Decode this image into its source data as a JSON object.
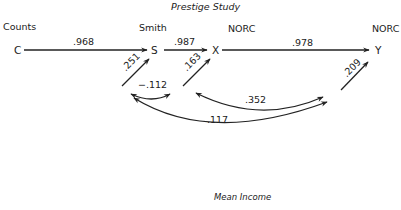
{
  "diagram": {
    "title": "Prestige Study",
    "footer": "Mean Income",
    "group_labels": {
      "counts": "Counts",
      "smith": "Smith",
      "norc_x": "NORC",
      "norc_y": "NORC"
    },
    "nodes": {
      "C": "C",
      "S": "S",
      "X": "X",
      "Y": "Y"
    },
    "paths": [
      {
        "from": "C",
        "to": "S",
        "coefficient": ".968"
      },
      {
        "from": "S",
        "to": "X",
        "coefficient": ".987"
      },
      {
        "from": "X",
        "to": "Y",
        "coefficient": ".978"
      },
      {
        "from": "residual",
        "to": "S",
        "coefficient": ".251"
      },
      {
        "from": "residual",
        "to": "X",
        "coefficient": ".163"
      },
      {
        "from": "residual",
        "to": "Y",
        "coefficient": ".209"
      }
    ],
    "correlations": [
      {
        "between": [
          "S residual",
          "X residual"
        ],
        "value": "−.112"
      },
      {
        "between": [
          "X residual",
          "Y residual"
        ],
        "value": ".352"
      },
      {
        "between": [
          "S residual",
          "Y residual"
        ],
        "value": ".117"
      }
    ],
    "colors": {
      "line": "#222222",
      "background": "#ffffff"
    }
  }
}
